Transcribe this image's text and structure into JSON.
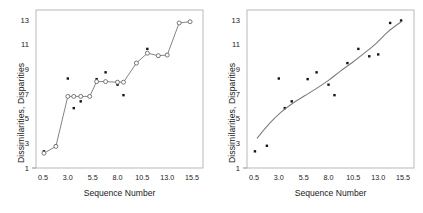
{
  "chart_data": [
    {
      "type": "scatter",
      "title": "",
      "panel": "left",
      "xlabel": "Sequence Number",
      "ylabel": "Dissimilarities, Disparities",
      "xlim": [
        -0.2,
        16.6
      ],
      "ylim": [
        1,
        13.8
      ],
      "xticks": [
        "0.5",
        "3.0",
        "5.5",
        "8.0",
        "10.5",
        "13.0",
        "15.5"
      ],
      "xtick_values": [
        0.5,
        3.0,
        5.5,
        8.0,
        10.5,
        13.0,
        15.5
      ],
      "yticks": [
        "1",
        "3",
        "5",
        "7",
        "9",
        "11",
        "13"
      ],
      "ytick_values": [
        1,
        3,
        5,
        7,
        9,
        11,
        13
      ],
      "grid": false,
      "legend": "none",
      "series": [
        {
          "name": "Dissimilarities",
          "marker": "filled-dot",
          "x": [
            0.6,
            1.8,
            3.0,
            3.6,
            4.3,
            5.9,
            6.8,
            8.0,
            8.6,
            9.9,
            11.0,
            12.1,
            13.0,
            14.2,
            15.3
          ],
          "y": [
            2.35,
            2.8,
            8.25,
            5.85,
            6.4,
            8.2,
            8.75,
            7.75,
            6.9,
            9.5,
            10.65,
            10.05,
            10.2,
            12.75,
            12.85
          ]
        },
        {
          "name": "Disparities (monotone fit)",
          "marker": "open-circle",
          "line": "step",
          "x": [
            0.6,
            1.8,
            3.0,
            3.6,
            4.3,
            5.2,
            5.9,
            6.8,
            8.0,
            8.6,
            9.9,
            11.0,
            12.1,
            13.0,
            14.2,
            15.3
          ],
          "y": [
            2.2,
            2.75,
            6.8,
            6.8,
            6.8,
            6.8,
            8.0,
            8.0,
            7.95,
            7.95,
            9.5,
            10.3,
            10.1,
            10.15,
            12.75,
            12.85
          ]
        }
      ]
    },
    {
      "type": "scatter",
      "title": "",
      "panel": "right",
      "xlabel": "Sequence Number",
      "ylabel": "Dissimilarities, Disparities",
      "xlim": [
        -0.2,
        16.6
      ],
      "ylim": [
        1,
        13.8
      ],
      "xticks": [
        "0.5",
        "3.0",
        "5.5",
        "8.0",
        "10.5",
        "13.0",
        "15.5"
      ],
      "xtick_values": [
        0.5,
        3.0,
        5.5,
        8.0,
        10.5,
        13.0,
        15.5
      ],
      "yticks": [
        "1",
        "3",
        "5",
        "7",
        "9",
        "11",
        "13"
      ],
      "ytick_values": [
        1,
        3,
        5,
        7,
        9,
        11,
        13
      ],
      "grid": false,
      "legend": "none",
      "series": [
        {
          "name": "Dissimilarities",
          "marker": "filled-dot",
          "x": [
            0.6,
            1.8,
            3.0,
            3.6,
            4.3,
            5.9,
            6.8,
            8.0,
            8.6,
            9.9,
            11.0,
            12.1,
            13.0,
            14.2,
            15.3
          ],
          "y": [
            2.35,
            2.8,
            8.25,
            5.85,
            6.4,
            8.2,
            8.75,
            7.75,
            6.9,
            9.5,
            10.65,
            10.05,
            10.2,
            12.75,
            12.95
          ]
        },
        {
          "name": "Smooth fit",
          "marker": "none",
          "line": "smooth",
          "x": [
            0.8,
            2.0,
            3.2,
            4.4,
            5.6,
            6.8,
            8.0,
            9.2,
            10.4,
            11.6,
            12.8,
            14.0,
            15.3
          ],
          "y": [
            3.4,
            4.55,
            5.5,
            6.25,
            6.85,
            7.45,
            8.1,
            8.85,
            9.55,
            10.3,
            11.1,
            12.05,
            12.85
          ]
        }
      ]
    }
  ]
}
